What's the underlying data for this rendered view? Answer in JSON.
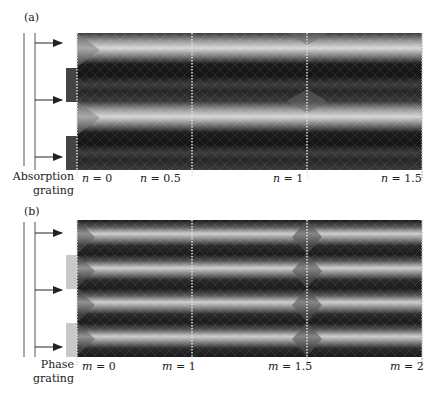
{
  "panels": [
    {
      "id": "a",
      "label": "(a)",
      "grating_label_line1": "Absorption",
      "grating_label_line2": "grating",
      "grating_type": "absorption",
      "grating_color": "#444444",
      "ticks": [
        {
          "var": "n",
          "eq": " = ",
          "value": "0"
        },
        {
          "var": "n",
          "eq": " = ",
          "value": "0.5"
        },
        {
          "var": "n",
          "eq": " = ",
          "value": "1"
        },
        {
          "var": "n",
          "eq": " = ",
          "value": "1.5"
        }
      ]
    },
    {
      "id": "b",
      "label": "(b)",
      "grating_label_line1": "Phase",
      "grating_label_line2": "grating",
      "grating_type": "phase",
      "grating_color": "#c8c8c8",
      "ticks": [
        {
          "var": "m",
          "eq": " = ",
          "value": "0"
        },
        {
          "var": "m",
          "eq": " = ",
          "value": "1"
        },
        {
          "var": "m",
          "eq": " = ",
          "value": "1.5"
        },
        {
          "var": "m",
          "eq": " = ",
          "value": "2"
        }
      ]
    }
  ]
}
